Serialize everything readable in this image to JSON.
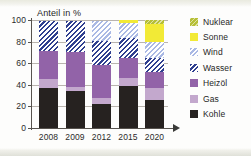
{
  "chart_data": {
    "type": "bar",
    "subtype": "stacked-bar-100",
    "title": "Anteil in %",
    "xlabel": "",
    "ylabel": "Anteil in %",
    "categories": [
      "2008",
      "2009",
      "2012",
      "2015",
      "2020"
    ],
    "ylim": [
      0,
      100
    ],
    "yticks": [
      0,
      20,
      40,
      60,
      80,
      100
    ],
    "ytick_labels": [
      "0",
      "20",
      "40",
      "60",
      "80",
      "100"
    ],
    "grid": true,
    "legend_position": "right",
    "series": [
      {
        "name": "Kohle",
        "color": "#262220",
        "pattern": "solid",
        "values": [
          37,
          34,
          22,
          39,
          26
        ]
      },
      {
        "name": "Gas",
        "color": "#c3a8cd",
        "pattern": "solid",
        "values": [
          8,
          4,
          6,
          7,
          11
        ]
      },
      {
        "name": "Heizöl",
        "color": "#9263a8",
        "pattern": "solid",
        "values": [
          26,
          32,
          30,
          19,
          15
        ]
      },
      {
        "name": "Wasser",
        "color": "#2f3f8f",
        "pattern": "hatch",
        "values": [
          28,
          29,
          23,
          18,
          13
        ]
      },
      {
        "name": "Wind",
        "color": "#aab9e4",
        "pattern": "hatch",
        "values": [
          0,
          0,
          18,
          14,
          15
        ]
      },
      {
        "name": "Sonne",
        "color": "#f2ea36",
        "pattern": "solid",
        "values": [
          0,
          0,
          0,
          3,
          16
        ]
      },
      {
        "name": "Nuklear",
        "color": "#b6bf36",
        "pattern": "hatch",
        "values": [
          0,
          0,
          0,
          0,
          4
        ]
      }
    ]
  },
  "legend": {
    "items": [
      {
        "label": "Nuklear",
        "swatch": "fill-nuklear"
      },
      {
        "label": "Sonne",
        "swatch": "fill-sonne"
      },
      {
        "label": "Wind",
        "swatch": "fill-wind"
      },
      {
        "label": "Wasser",
        "swatch": "fill-wasser"
      },
      {
        "label": "Heizöl",
        "swatch": "fill-heizol"
      },
      {
        "label": "Gas",
        "swatch": "fill-gas"
      },
      {
        "label": "Kohle",
        "swatch": "fill-kohle"
      }
    ]
  }
}
